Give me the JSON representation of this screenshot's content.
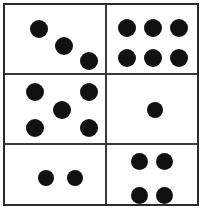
{
  "figure": {
    "name": "dice-face-grid",
    "width": 206,
    "height": 213,
    "background_color": "#ffffff",
    "border_color": "#2b2b2b",
    "divider_color": "#3a3a3a",
    "pip_color": "#111111",
    "rows": 3,
    "columns": 2,
    "total_cells": 6
  },
  "frame": {
    "x": 3,
    "y": 3,
    "width": 196,
    "height": 203,
    "border_width": 2
  },
  "dividers": {
    "vertical": [
      {
        "name": "divider-vertical-center",
        "x": 100,
        "y": 0,
        "length": 199,
        "thickness": 2
      }
    ],
    "horizontal": [
      {
        "name": "divider-horizontal-upper",
        "x": 0,
        "y": 68,
        "length": 192,
        "thickness": 2
      },
      {
        "name": "divider-horizontal-lower",
        "x": 0,
        "y": 138,
        "length": 192,
        "thickness": 2
      }
    ]
  },
  "cells": [
    {
      "name": "cell-top-left",
      "position": "top-left",
      "row": 1,
      "column": 1,
      "pip_count": 3,
      "pattern": "diagonal",
      "x": 5,
      "y": 5,
      "width": 95,
      "height": 63,
      "pips": [
        {
          "name": "pip",
          "cx": 29,
          "cy": 19,
          "d": 18
        },
        {
          "name": "pip",
          "cx": 54,
          "cy": 36,
          "d": 18
        },
        {
          "name": "pip",
          "cx": 79,
          "cy": 51,
          "d": 18
        }
      ]
    },
    {
      "name": "cell-top-right",
      "position": "top-right",
      "row": 1,
      "column": 2,
      "pip_count": 6,
      "pattern": "three-by-two-grid",
      "x": 102,
      "y": 5,
      "width": 95,
      "height": 63,
      "pips": [
        {
          "name": "pip",
          "cx": 20,
          "cy": 18,
          "d": 18
        },
        {
          "name": "pip",
          "cx": 46,
          "cy": 18,
          "d": 18
        },
        {
          "name": "pip",
          "cx": 72,
          "cy": 18,
          "d": 18
        },
        {
          "name": "pip",
          "cx": 20,
          "cy": 48,
          "d": 18
        },
        {
          "name": "pip",
          "cx": 46,
          "cy": 48,
          "d": 18
        },
        {
          "name": "pip",
          "cx": 72,
          "cy": 48,
          "d": 18
        }
      ]
    },
    {
      "name": "cell-middle-left",
      "position": "middle-left",
      "row": 2,
      "column": 1,
      "pip_count": 5,
      "pattern": "quincunx",
      "x": 5,
      "y": 72,
      "width": 95,
      "height": 66,
      "pips": [
        {
          "name": "pip",
          "cx": 25,
          "cy": 15,
          "d": 18
        },
        {
          "name": "pip",
          "cx": 79,
          "cy": 15,
          "d": 18
        },
        {
          "name": "pip",
          "cx": 52,
          "cy": 33,
          "d": 18
        },
        {
          "name": "pip",
          "cx": 25,
          "cy": 51,
          "d": 18
        },
        {
          "name": "pip",
          "cx": 79,
          "cy": 51,
          "d": 18
        }
      ]
    },
    {
      "name": "cell-middle-right",
      "position": "middle-right",
      "row": 2,
      "column": 2,
      "pip_count": 1,
      "pattern": "center",
      "x": 102,
      "y": 72,
      "width": 95,
      "height": 66,
      "pips": [
        {
          "name": "pip",
          "cx": 48,
          "cy": 33,
          "d": 16
        }
      ]
    },
    {
      "name": "cell-bottom-left",
      "position": "bottom-left",
      "row": 3,
      "column": 1,
      "pip_count": 2,
      "pattern": "horizontal-pair",
      "x": 5,
      "y": 142,
      "width": 95,
      "height": 62,
      "pips": [
        {
          "name": "pip",
          "cx": 36,
          "cy": 31,
          "d": 16
        },
        {
          "name": "pip",
          "cx": 65,
          "cy": 31,
          "d": 16
        }
      ]
    },
    {
      "name": "cell-bottom-right",
      "position": "bottom-right",
      "row": 3,
      "column": 2,
      "pip_count": 4,
      "pattern": "square",
      "x": 102,
      "y": 142,
      "width": 95,
      "height": 62,
      "pips": [
        {
          "name": "pip",
          "cx": 32,
          "cy": 14,
          "d": 17
        },
        {
          "name": "pip",
          "cx": 57,
          "cy": 14,
          "d": 17
        },
        {
          "name": "pip",
          "cx": 32,
          "cy": 48,
          "d": 17
        },
        {
          "name": "pip",
          "cx": 57,
          "cy": 48,
          "d": 17
        }
      ]
    }
  ]
}
